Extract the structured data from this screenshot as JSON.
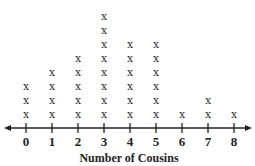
{
  "chart_data": {
    "type": "line-plot",
    "title": "",
    "xlabel": "Number of Cousins",
    "ylabel": "",
    "categories": [
      0,
      1,
      2,
      3,
      4,
      5,
      6,
      7,
      8
    ],
    "values": [
      3,
      4,
      5,
      8,
      6,
      6,
      1,
      2,
      1
    ],
    "marker": "X",
    "xlim": [
      0,
      8
    ],
    "grid": false,
    "legend": null
  },
  "colors": {
    "ink": "#222222",
    "background": "#ffffff"
  }
}
